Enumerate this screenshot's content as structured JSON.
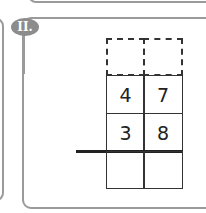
{
  "exercise": {
    "badge_label": "II.",
    "carry_row": [
      "",
      ""
    ],
    "minuend": [
      "4",
      "7"
    ],
    "operator": "–",
    "subtrahend": [
      "3",
      "8"
    ],
    "result": [
      "",
      ""
    ]
  },
  "colors": {
    "badge_bg": "#8c8c8c",
    "panel_border": "#9a9a9a",
    "grid_line": "#333333"
  }
}
